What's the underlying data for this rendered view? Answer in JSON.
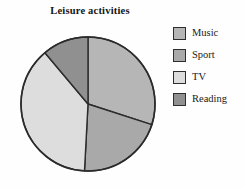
{
  "chart_data": {
    "type": "pie",
    "title": "Leisure activities",
    "xlabel": "",
    "ylabel": "",
    "legend_position": "right",
    "grid": false,
    "categories": [
      "Music",
      "Sport",
      "TV",
      "Reading"
    ],
    "values": [
      30,
      21,
      38,
      11
    ],
    "units": "percent",
    "start_angle_deg": 0,
    "direction": "clockwise",
    "slices": [
      {
        "label": "Music",
        "value": 30,
        "start_angle_deg": 0,
        "end_angle_deg": 108,
        "color": "#b6b6b6"
      },
      {
        "label": "Sport",
        "value": 21,
        "start_angle_deg": 108,
        "end_angle_deg": 183,
        "color": "#a9a9a9"
      },
      {
        "label": "TV",
        "value": 38,
        "start_angle_deg": 183,
        "end_angle_deg": 320,
        "color": "#dddddd"
      },
      {
        "label": "Reading",
        "value": 11,
        "start_angle_deg": 320,
        "end_angle_deg": 360,
        "color": "#909090"
      }
    ],
    "outline_color": "#2b2b2b"
  },
  "legend": {
    "items": [
      {
        "label": "Music",
        "color": "#b6b6b6"
      },
      {
        "label": "Sport",
        "color": "#a9a9a9"
      },
      {
        "label": "TV",
        "color": "#dddddd"
      },
      {
        "label": "Reading",
        "color": "#909090"
      }
    ]
  }
}
